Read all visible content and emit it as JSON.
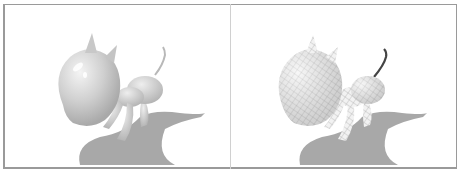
{
  "figure": {
    "panels": [
      {
        "id": "left",
        "rendering": "smooth-shaded",
        "subject": "cartoon dog 3D model"
      },
      {
        "id": "right",
        "rendering": "wireframe-textured",
        "subject": "cartoon dog 3D model"
      }
    ],
    "colors": {
      "border": "#9a9a9a",
      "divider": "#d0d0d0",
      "shadow": "#a8a8a8",
      "body": "#d8d8d8",
      "tail_dark": "#444444"
    }
  }
}
